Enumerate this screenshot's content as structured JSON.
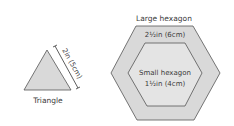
{
  "shapes": {
    "triangle": {
      "label": "Triangle",
      "dimension": "2in (5cm)"
    },
    "large_hexagon": {
      "label": "Large hexagon",
      "dimension": "2½in (6cm)"
    },
    "small_hexagon": {
      "label": "Small hexagon",
      "dimension": "1½in (4cm)"
    }
  },
  "colors": {
    "fill": "#d9d9d9",
    "inner_fill": "#e8e8e8",
    "stroke": "#555555"
  }
}
